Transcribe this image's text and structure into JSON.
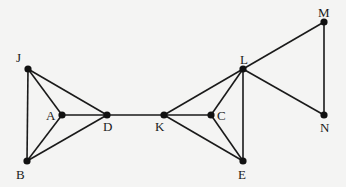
{
  "diagram": {
    "type": "graph",
    "background": "#f4f4f3",
    "edge_color": "#1a1a1a",
    "node_color": "#111111",
    "nodes": [
      {
        "id": "J",
        "label": "J",
        "x": 28,
        "y": 69,
        "lx": 16,
        "ly": 62
      },
      {
        "id": "A",
        "label": "A",
        "x": 62,
        "y": 115,
        "lx": 46,
        "ly": 120
      },
      {
        "id": "D",
        "label": "D",
        "x": 107,
        "y": 115,
        "lx": 103,
        "ly": 131
      },
      {
        "id": "B",
        "label": "B",
        "x": 27,
        "y": 161,
        "lx": 16,
        "ly": 179
      },
      {
        "id": "K",
        "label": "K",
        "x": 164,
        "y": 115,
        "lx": 155,
        "ly": 131
      },
      {
        "id": "C",
        "label": "C",
        "x": 211,
        "y": 115,
        "lx": 217,
        "ly": 120
      },
      {
        "id": "L",
        "label": "L",
        "x": 243,
        "y": 69,
        "lx": 240,
        "ly": 64
      },
      {
        "id": "E",
        "label": "E",
        "x": 243,
        "y": 161,
        "lx": 238,
        "ly": 179
      },
      {
        "id": "M",
        "label": "M",
        "x": 324,
        "y": 22,
        "lx": 318,
        "ly": 17
      },
      {
        "id": "N",
        "label": "N",
        "x": 324,
        "y": 115,
        "lx": 320,
        "ly": 132
      }
    ],
    "edges": [
      [
        "J",
        "A"
      ],
      [
        "J",
        "D"
      ],
      [
        "J",
        "B"
      ],
      [
        "A",
        "D"
      ],
      [
        "A",
        "B"
      ],
      [
        "B",
        "D"
      ],
      [
        "D",
        "K"
      ],
      [
        "K",
        "L"
      ],
      [
        "K",
        "C"
      ],
      [
        "K",
        "E"
      ],
      [
        "C",
        "L"
      ],
      [
        "C",
        "E"
      ],
      [
        "L",
        "E"
      ],
      [
        "L",
        "M"
      ],
      [
        "L",
        "N"
      ],
      [
        "M",
        "N"
      ]
    ]
  }
}
